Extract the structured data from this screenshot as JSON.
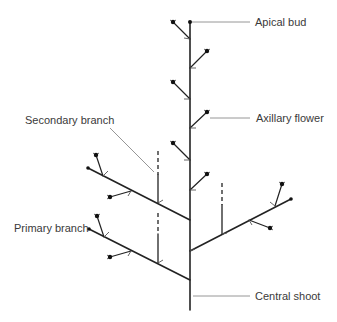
{
  "diagram": {
    "type": "plant-branching-structure",
    "labels": {
      "apical_bud": "Apical bud",
      "axillary_flower": "Axillary flower",
      "secondary_branch": "Secondary branch",
      "primary_branch": "Primary branch",
      "central_shoot": "Central shoot"
    },
    "colors": {
      "stem": "#222222",
      "leader": "#8a8a8a",
      "text": "#3a3a3a",
      "background": "#ffffff"
    }
  }
}
